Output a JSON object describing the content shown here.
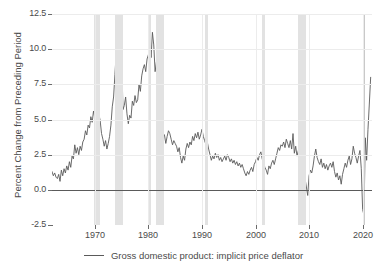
{
  "chart_data": {
    "type": "line",
    "title": "",
    "xlabel": "",
    "ylabel": "Percent Change from Preceding Period",
    "xlim": [
      1962.0,
      2021.75
    ],
    "ylim": [
      -2.5,
      12.5
    ],
    "yticks": [
      -2.5,
      0.0,
      2.5,
      5.0,
      7.5,
      10.0,
      12.5
    ],
    "ytick_labels": [
      "-2.5",
      "0.0",
      "2.5",
      "5.0",
      "7.5",
      "10.0",
      "12.5"
    ],
    "xticks": [
      1970,
      1980,
      1990,
      2000,
      2010,
      2020
    ],
    "xtick_labels": [
      "1970",
      "1980",
      "1990",
      "2000",
      "2010",
      "2020"
    ],
    "grid": true,
    "zero_line": 0.0,
    "legend_position": "below-center",
    "series": [
      {
        "name": "Gross domestic product: implicit price deflator",
        "color": "#5a5a5a",
        "x": [
          1962.0,
          1962.25,
          1962.5,
          1962.75,
          1963.0,
          1963.25,
          1963.5,
          1963.75,
          1964.0,
          1964.25,
          1964.5,
          1964.75,
          1965.0,
          1965.25,
          1965.5,
          1965.75,
          1966.0,
          1966.25,
          1966.5,
          1966.75,
          1967.0,
          1967.25,
          1967.5,
          1967.75,
          1968.0,
          1968.25,
          1968.5,
          1968.75,
          1969.0,
          1969.25,
          1969.5,
          1969.75,
          1970.0,
          1970.25,
          1970.5,
          1970.75,
          1971.0,
          1971.25,
          1971.5,
          1971.75,
          1972.0,
          1972.25,
          1972.5,
          1972.75,
          1973.0,
          1973.25,
          1973.5,
          1973.75,
          1974.0,
          1974.25,
          1974.5,
          1974.75,
          1975.0,
          1975.25,
          1975.5,
          1975.75,
          1976.0,
          1976.25,
          1976.5,
          1976.75,
          1977.0,
          1977.25,
          1977.5,
          1977.75,
          1978.0,
          1978.25,
          1978.5,
          1978.75,
          1979.0,
          1979.25,
          1979.5,
          1979.75,
          1980.0,
          1980.25,
          1980.5,
          1980.75,
          1981.0,
          1981.25,
          1981.5,
          1981.75,
          1982.0,
          1982.25,
          1982.5,
          1982.75,
          1983.0,
          1983.25,
          1983.5,
          1983.75,
          1984.0,
          1984.25,
          1984.5,
          1984.75,
          1985.0,
          1985.25,
          1985.5,
          1985.75,
          1986.0,
          1986.25,
          1986.5,
          1986.75,
          1987.0,
          1987.25,
          1987.5,
          1987.75,
          1988.0,
          1988.25,
          1988.5,
          1988.75,
          1989.0,
          1989.25,
          1989.5,
          1989.75,
          1990.0,
          1990.25,
          1990.5,
          1990.75,
          1991.0,
          1991.25,
          1991.5,
          1991.75,
          1992.0,
          1992.25,
          1992.5,
          1992.75,
          1993.0,
          1993.25,
          1993.5,
          1993.75,
          1994.0,
          1994.25,
          1994.5,
          1994.75,
          1995.0,
          1995.25,
          1995.5,
          1995.75,
          1996.0,
          1996.25,
          1996.5,
          1996.75,
          1997.0,
          1997.25,
          1997.5,
          1997.75,
          1998.0,
          1998.25,
          1998.5,
          1998.75,
          1999.0,
          1999.25,
          1999.5,
          1999.75,
          2000.0,
          2000.25,
          2000.5,
          2000.75,
          2001.0,
          2001.25,
          2001.5,
          2001.75,
          2002.0,
          2002.25,
          2002.5,
          2002.75,
          2003.0,
          2003.25,
          2003.5,
          2003.75,
          2004.0,
          2004.25,
          2004.5,
          2004.75,
          2005.0,
          2005.25,
          2005.5,
          2005.75,
          2006.0,
          2006.25,
          2006.5,
          2006.75,
          2007.0,
          2007.25,
          2007.5,
          2007.75,
          2008.0,
          2008.25,
          2008.5,
          2008.75,
          2009.0,
          2009.25,
          2009.5,
          2009.75,
          2010.0,
          2010.25,
          2010.5,
          2010.75,
          2011.0,
          2011.25,
          2011.5,
          2011.75,
          2012.0,
          2012.25,
          2012.5,
          2012.75,
          2013.0,
          2013.25,
          2013.5,
          2013.75,
          2014.0,
          2014.25,
          2014.5,
          2014.75,
          2015.0,
          2015.25,
          2015.5,
          2015.75,
          2016.0,
          2016.25,
          2016.5,
          2016.75,
          2017.0,
          2017.25,
          2017.5,
          2017.75,
          2018.0,
          2018.25,
          2018.5,
          2018.75,
          2019.0,
          2019.25,
          2019.5,
          2019.75,
          2020.0,
          2020.25,
          2020.5,
          2020.75,
          2021.0,
          2021.25,
          2021.5
        ],
        "y": [
          1.3,
          1.0,
          1.2,
          0.9,
          0.8,
          1.1,
          0.6,
          1.4,
          1.0,
          1.5,
          1.2,
          1.7,
          1.4,
          2.0,
          1.6,
          2.4,
          2.2,
          3.2,
          2.6,
          3.0,
          2.5,
          3.1,
          2.8,
          3.4,
          3.6,
          4.2,
          3.9,
          4.6,
          4.4,
          5.2,
          4.8,
          5.6,
          5.1,
          4.3,
          4.7,
          5.4,
          4.9,
          4.0,
          3.6,
          3.1,
          3.5,
          2.9,
          3.3,
          3.8,
          4.6,
          5.9,
          6.6,
          8.2,
          9.8,
          10.4,
          11.3,
          12.3,
          9.6,
          5.7,
          6.0,
          6.6,
          5.4,
          4.7,
          5.3,
          5.1,
          6.3,
          6.0,
          6.7,
          6.2,
          6.4,
          7.5,
          7.0,
          8.1,
          8.6,
          8.9,
          8.4,
          9.3,
          9.6,
          10.5,
          9.4,
          11.2,
          10.3,
          8.4,
          9.1,
          7.9,
          6.8,
          5.3,
          4.6,
          4.0,
          3.9,
          3.3,
          3.8,
          4.2,
          4.0,
          3.6,
          3.2,
          3.5,
          3.3,
          3.1,
          2.7,
          3.0,
          2.3,
          1.9,
          2.4,
          2.1,
          2.9,
          3.3,
          3.0,
          3.4,
          3.2,
          3.8,
          3.5,
          4.0,
          3.7,
          4.1,
          3.6,
          3.9,
          4.3,
          3.8,
          3.5,
          3.2,
          3.4,
          2.9,
          2.5,
          2.1,
          2.4,
          2.2,
          2.6,
          2.3,
          2.5,
          2.1,
          2.3,
          2.0,
          2.2,
          2.4,
          2.1,
          2.5,
          2.3,
          2.0,
          2.2,
          1.9,
          2.1,
          1.8,
          2.0,
          1.7,
          1.9,
          1.6,
          1.8,
          1.5,
          1.2,
          1.0,
          1.3,
          1.1,
          1.4,
          1.6,
          1.3,
          1.8,
          2.0,
          2.3,
          2.1,
          2.5,
          2.7,
          2.2,
          1.9,
          1.6,
          1.4,
          1.1,
          1.7,
          1.5,
          1.9,
          2.1,
          1.8,
          2.2,
          2.6,
          3.0,
          2.8,
          3.2,
          3.1,
          3.4,
          3.0,
          3.6,
          3.3,
          3.0,
          3.5,
          2.9,
          4.0,
          2.6,
          3.1,
          2.4,
          2.8,
          3.4,
          2.7,
          2.2,
          1.6,
          0.8,
          0.2,
          -0.4,
          1.0,
          1.4,
          1.2,
          1.7,
          2.4,
          2.9,
          2.3,
          2.0,
          1.8,
          2.2,
          1.6,
          1.9,
          1.5,
          1.8,
          1.4,
          1.7,
          1.9,
          1.6,
          2.0,
          1.3,
          0.9,
          1.2,
          0.7,
          1.0,
          0.4,
          1.1,
          1.5,
          1.9,
          1.6,
          2.1,
          2.4,
          1.8,
          2.2,
          3.1,
          2.6,
          2.3,
          1.9,
          2.4,
          2.8,
          1.5,
          -1.4,
          -1.8,
          3.7,
          2.1,
          4.3,
          6.1,
          8.0
        ]
      }
    ],
    "recessions": [
      {
        "start": 1969.92,
        "end": 1970.92,
        "shade": "light"
      },
      {
        "start": 1973.83,
        "end": 1975.17,
        "shade": "light"
      },
      {
        "start": 1980.0,
        "end": 1980.5,
        "shade": "light"
      },
      {
        "start": 1981.5,
        "end": 1982.92,
        "shade": "light"
      },
      {
        "start": 1990.5,
        "end": 1991.17,
        "shade": "light"
      },
      {
        "start": 2001.17,
        "end": 2001.83,
        "shade": "light"
      },
      {
        "start": 2007.92,
        "end": 2009.5,
        "shade": "light"
      },
      {
        "start": 2020.0,
        "end": 2020.33,
        "shade": "dark"
      }
    ]
  },
  "legend": {
    "label": "Gross domestic product: implicit price deflator",
    "swatch_color": "#5a5a5a"
  },
  "axes": {
    "ylabel": "Percent Change from Preceding Period"
  },
  "colors": {
    "line": "#5a5a5a",
    "grid": "#ececec",
    "zero_line": "#5a5a5a",
    "axis": "#6b6b6b",
    "recession_light": "#e2e2e2",
    "recession_dark": "#c9c9c9",
    "background": "#ffffff",
    "text": "#4a4a4a"
  }
}
